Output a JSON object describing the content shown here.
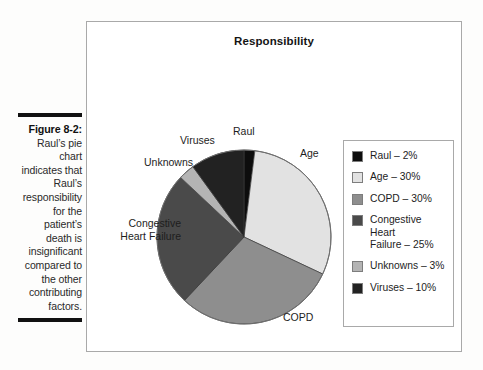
{
  "caption": {
    "figure_number": "Figure 8-2:",
    "body": " Raul’s pie chart indicates that Raul’s responsibility for the patient’s death is insignificant compared to the other contributing factors."
  },
  "chart_data": {
    "type": "pie",
    "title": "Responsibility",
    "xlabel": "",
    "ylabel": "",
    "legend_position": "right",
    "grid": false,
    "start_angle_deg": 0,
    "direction": "clockwise",
    "categories": [
      "Raul",
      "Age",
      "COPD",
      "Congestive Heart Failure",
      "Unknowns",
      "Viruses"
    ],
    "values": [
      2,
      30,
      30,
      25,
      3,
      10
    ],
    "value_unit": "%",
    "colors": [
      "#0d0d0d",
      "#e2e2e2",
      "#8e8e8e",
      "#4a4a4a",
      "#b4b4b4",
      "#222222"
    ],
    "slice_labels": [
      {
        "name": "Raul",
        "text": "Raul"
      },
      {
        "name": "Age",
        "text": "Age"
      },
      {
        "name": "COPD",
        "text": "COPD"
      },
      {
        "name": "Congestive Heart Failure",
        "text": "Congestive\nHeart Failure"
      },
      {
        "name": "Unknowns",
        "text": "Unknowns"
      },
      {
        "name": "Viruses",
        "text": "Viruses"
      }
    ],
    "legend_entries": [
      {
        "label": "Raul – 2%",
        "color": "#0d0d0d"
      },
      {
        "label": "Age – 30%",
        "color": "#e2e2e2"
      },
      {
        "label": "COPD – 30%",
        "color": "#8e8e8e"
      },
      {
        "label": "Congestive Heart Failure – 25%",
        "color": "#4a4a4a"
      },
      {
        "label": "Unknowns – 3%",
        "color": "#b4b4b4"
      },
      {
        "label": "Viruses – 10%",
        "color": "#222222"
      }
    ]
  },
  "pie_labels": {
    "raul": "Raul",
    "age": "Age",
    "viruses": "Viruses",
    "unknowns": "Unknowns",
    "chf_line1": "Congestive",
    "chf_line2": "Heart Failure",
    "copd": "COPD"
  },
  "legend": {
    "items": [
      "Raul – 2%",
      "Age – 30%",
      "COPD – 30%",
      "Congestive Heart",
      "Failure – 25%",
      "Unknowns – 3%",
      "Viruses – 10%"
    ],
    "item0": "Raul – 2%",
    "item1": "Age – 30%",
    "item2": "COPD – 30%",
    "item3_line1": "Congestive Heart",
    "item3_line2": "Failure – 25%",
    "item4": "Unknowns – 3%",
    "item5": "Viruses – 10%"
  }
}
